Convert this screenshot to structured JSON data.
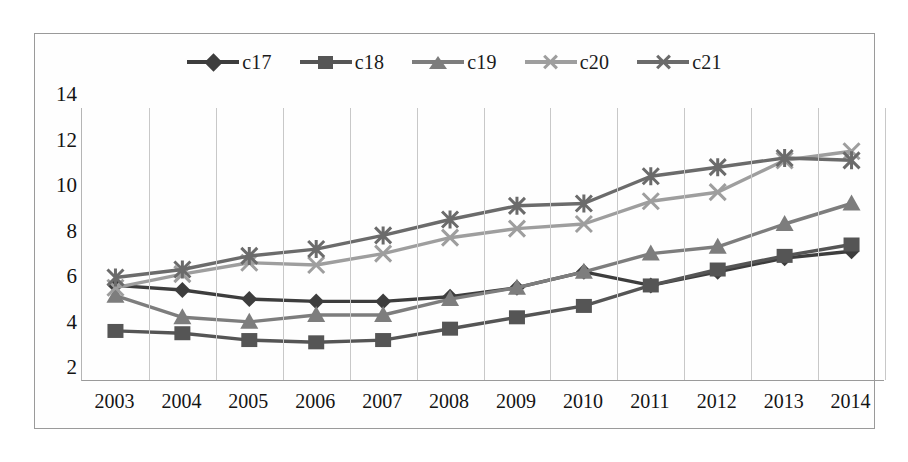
{
  "chart_data": {
    "type": "line",
    "title": "",
    "subtitle": "",
    "xlabel": "",
    "ylabel": "",
    "categories": [
      "2003",
      "2004",
      "2005",
      "2006",
      "2007",
      "2008",
      "2009",
      "2010",
      "2011",
      "2012",
      "2013",
      "2014"
    ],
    "x": [
      2003,
      2004,
      2005,
      2006,
      2007,
      2008,
      2009,
      2010,
      2011,
      2012,
      2013,
      2014
    ],
    "ylim": [
      2,
      14
    ],
    "yticks": [
      2,
      4,
      6,
      8,
      10,
      12,
      14
    ],
    "ytick_labels": [
      "2",
      "4",
      "6",
      "8",
      "10",
      "12",
      "14"
    ],
    "grid": "vertical",
    "legend_position": "top-center",
    "series": [
      {
        "name": "c17",
        "marker": "diamond",
        "color": "#3d3d3d",
        "values": [
          6.2,
          6.0,
          5.6,
          5.5,
          5.5,
          5.7,
          6.1,
          6.8,
          6.2,
          6.8,
          7.4,
          7.7
        ]
      },
      {
        "name": "c18",
        "marker": "square",
        "color": "#555555",
        "values": [
          4.2,
          4.1,
          3.8,
          3.7,
          3.8,
          4.3,
          4.8,
          5.3,
          6.2,
          6.9,
          7.5,
          8.0
        ]
      },
      {
        "name": "c19",
        "marker": "triangle",
        "color": "#7d7d7d",
        "values": [
          5.75,
          4.8,
          4.6,
          4.9,
          4.9,
          5.6,
          6.1,
          6.8,
          7.6,
          7.9,
          8.9,
          9.8
        ]
      },
      {
        "name": "c20",
        "marker": "x-cross",
        "color": "#9e9e9e",
        "values": [
          6.1,
          6.7,
          7.2,
          7.1,
          7.6,
          8.3,
          8.7,
          8.9,
          9.9,
          10.3,
          11.7,
          12.1
        ]
      },
      {
        "name": "c21",
        "marker": "asterisk",
        "color": "#6b6b6b",
        "values": [
          6.55,
          6.9,
          7.5,
          7.8,
          8.4,
          9.1,
          9.7,
          9.8,
          11.0,
          11.4,
          11.8,
          11.7
        ]
      }
    ]
  },
  "legend": {
    "items": [
      {
        "label": "c17"
      },
      {
        "label": "c18"
      },
      {
        "label": "c19"
      },
      {
        "label": "c20"
      },
      {
        "label": "c21"
      }
    ]
  },
  "axes": {
    "y_tick_labels": [
      "14",
      "12",
      "10",
      "8",
      "6",
      "4",
      "2"
    ],
    "x_tick_labels": [
      "2003",
      "2004",
      "2005",
      "2006",
      "2007",
      "2008",
      "2009",
      "2010",
      "2011",
      "2012",
      "2013",
      "2014"
    ]
  }
}
